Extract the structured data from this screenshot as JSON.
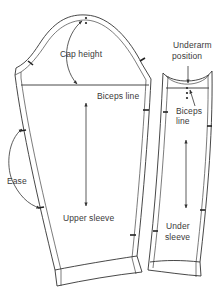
{
  "diagram": {
    "pieces": [
      {
        "name": "Upper sleeve",
        "labels": {
          "cap_height": "Cap height",
          "biceps_line": "Biceps line",
          "ease": "Ease",
          "piece_name": "Upper sleeve"
        }
      },
      {
        "name": "Under sleeve",
        "labels": {
          "underarm_line1": "Underarm",
          "underarm_line2": "position",
          "biceps_line1": "Biceps",
          "biceps_line2": "line",
          "piece_name_line1": "Under",
          "piece_name_line2": "sleeve"
        }
      }
    ],
    "colors": {
      "stroke": "#333333",
      "text": "#3a3a3a",
      "background": "#ffffff"
    }
  }
}
